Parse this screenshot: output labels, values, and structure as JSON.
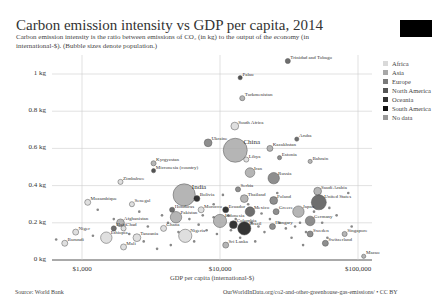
{
  "header": {
    "title": "Carbon emission intensity vs GDP per capita, 2014",
    "subtitle": "Carbon emission intensity is the ratio between emissions of CO₂ (in kg) to the output of the economy (in international-$). (Bubble sizes denote population.)"
  },
  "footer": {
    "source": "Source: World Bank",
    "url": "OurWorldInData.org/co2-and-other-greenhouse-gas-emissions/ • CC BY"
  },
  "legend": [
    {
      "label": "Africa",
      "color": "#d9d9d9"
    },
    {
      "label": "Asia",
      "color": "#a8a8a8"
    },
    {
      "label": "Europe",
      "color": "#7a7a7a"
    },
    {
      "label": "North America",
      "color": "#555555"
    },
    {
      "label": "Oceania",
      "color": "#333333"
    },
    {
      "label": "South America",
      "color": "#111111"
    },
    {
      "label": "No data",
      "color": "#999999"
    }
  ],
  "chart_data": {
    "type": "scatter",
    "title": "Carbon emission intensity vs GDP per capita, 2014",
    "subtitle": "Carbon emission intensity is the ratio between emissions of CO₂ (in kg) to the output of the economy (in international-$). (Bubble sizes denote population.)",
    "xlabel": "GDP per capita (international-$)",
    "ylabel": "",
    "xscale": "log",
    "xlim": [
      400,
      130000
    ],
    "ylim": [
      0,
      1.1
    ],
    "x_ticks": [
      "$1,000",
      "$10,000",
      "$100,000"
    ],
    "y_ticks": [
      "0 kg",
      "0.2 kg",
      "0.4 kg",
      "0.6 kg",
      "0.8 kg",
      "1 kg"
    ],
    "grid": true,
    "legend_position": "right",
    "points": [
      {
        "label": "Trinidad and Tobago",
        "x": 31000,
        "y": 1.07,
        "region": "North America",
        "size": 1.5
      },
      {
        "label": "Palau",
        "x": 14000,
        "y": 0.98,
        "region": "Oceania",
        "size": 1
      },
      {
        "label": "Turkmenistan",
        "x": 14500,
        "y": 0.87,
        "region": "Asia",
        "size": 1.5
      },
      {
        "label": "South Africa",
        "x": 12800,
        "y": 0.72,
        "region": "Africa",
        "size": 3
      },
      {
        "label": "Aruba",
        "x": 36000,
        "y": 0.65,
        "region": "North America",
        "size": 1
      },
      {
        "label": "Ukraine",
        "x": 8200,
        "y": 0.63,
        "region": "Europe",
        "size": 3
      },
      {
        "label": "China",
        "x": 12900,
        "y": 0.59,
        "region": "Asia",
        "size": 12
      },
      {
        "label": "Kazakhstan",
        "x": 23000,
        "y": 0.6,
        "region": "Asia",
        "size": 2
      },
      {
        "label": "Libya",
        "x": 15500,
        "y": 0.54,
        "region": "Africa",
        "size": 1.5
      },
      {
        "label": "Estonia",
        "x": 27000,
        "y": 0.55,
        "region": "Europe",
        "size": 1
      },
      {
        "label": "Bahrain",
        "x": 45000,
        "y": 0.53,
        "region": "Asia",
        "size": 1
      },
      {
        "label": "Kyrgyzstan",
        "x": 3300,
        "y": 0.52,
        "region": "Asia",
        "size": 1.5
      },
      {
        "label": "Micronesia (country)",
        "x": 3300,
        "y": 0.48,
        "region": "Oceania",
        "size": 1
      },
      {
        "label": "Iran",
        "x": 16500,
        "y": 0.47,
        "region": "Asia",
        "size": 4
      },
      {
        "label": "Russia",
        "x": 24500,
        "y": 0.44,
        "region": "Europe",
        "size": 5
      },
      {
        "label": "Zimbabwe",
        "x": 1900,
        "y": 0.42,
        "region": "Africa",
        "size": 1.5
      },
      {
        "label": "Serbia",
        "x": 13500,
        "y": 0.38,
        "region": "Europe",
        "size": 1.5
      },
      {
        "label": "Saudi Arabia",
        "x": 51000,
        "y": 0.37,
        "region": "Asia",
        "size": 3
      },
      {
        "label": "India",
        "x": 5500,
        "y": 0.35,
        "region": "Asia",
        "size": 11
      },
      {
        "label": "Bolivia",
        "x": 6800,
        "y": 0.33,
        "region": "South America",
        "size": 2
      },
      {
        "label": "United States",
        "x": 52000,
        "y": 0.31,
        "region": "North America",
        "size": 7
      },
      {
        "label": "Thailand",
        "x": 15000,
        "y": 0.33,
        "region": "Asia",
        "size": 3
      },
      {
        "label": "Poland",
        "x": 24500,
        "y": 0.32,
        "region": "Europe",
        "size": 3
      },
      {
        "label": "Mozambique",
        "x": 1100,
        "y": 0.31,
        "region": "Africa",
        "size": 2
      },
      {
        "label": "Senegal",
        "x": 2300,
        "y": 0.3,
        "region": "Africa",
        "size": 1.5
      },
      {
        "label": "Honduras",
        "x": 4500,
        "y": 0.27,
        "region": "North America",
        "size": 1.5
      },
      {
        "label": "Morocco",
        "x": 7300,
        "y": 0.27,
        "region": "Africa",
        "size": 2
      },
      {
        "label": "Ecuador",
        "x": 11000,
        "y": 0.27,
        "region": "South America",
        "size": 2
      },
      {
        "label": "Mexico",
        "x": 16500,
        "y": 0.26,
        "region": "North America",
        "size": 4
      },
      {
        "label": "Greece",
        "x": 25500,
        "y": 0.26,
        "region": "Europe",
        "size": 2
      },
      {
        "label": "Japan",
        "x": 37000,
        "y": 0.26,
        "region": "Asia",
        "size": 5
      },
      {
        "label": "Pakistan",
        "x": 4800,
        "y": 0.23,
        "region": "Asia",
        "size": 5
      },
      {
        "label": "Indonesia",
        "x": 10000,
        "y": 0.21,
        "region": "Asia",
        "size": 6
      },
      {
        "label": "Germany",
        "x": 45000,
        "y": 0.21,
        "region": "Europe",
        "size": 4
      },
      {
        "label": "Afghanistan",
        "x": 1900,
        "y": 0.2,
        "region": "Asia",
        "size": 3
      },
      {
        "label": "Colombia",
        "x": 12500,
        "y": 0.19,
        "region": "South America",
        "size": 3
      },
      {
        "label": "Hungary",
        "x": 24000,
        "y": 0.18,
        "region": "Europe",
        "size": 2
      },
      {
        "label": "Brazil",
        "x": 15000,
        "y": 0.17,
        "region": "South America",
        "size": 6
      },
      {
        "label": "Haiti",
        "x": 1700,
        "y": 0.17,
        "region": "North America",
        "size": 1.5
      },
      {
        "label": "Chad",
        "x": 2000,
        "y": 0.17,
        "region": "Africa",
        "size": 1.5
      },
      {
        "label": "Ghana",
        "x": 3900,
        "y": 0.17,
        "region": "Africa",
        "size": 2
      },
      {
        "label": "Sweden",
        "x": 45000,
        "y": 0.14,
        "region": "Europe",
        "size": 2
      },
      {
        "label": "Singapore",
        "x": 80000,
        "y": 0.14,
        "region": "Asia",
        "size": 1.5
      },
      {
        "label": "Niger",
        "x": 900,
        "y": 0.15,
        "region": "Africa",
        "size": 2
      },
      {
        "label": "Ethiopia",
        "x": 1500,
        "y": 0.12,
        "region": "Africa",
        "size": 5
      },
      {
        "label": "Tanzania",
        "x": 2500,
        "y": 0.12,
        "region": "Africa",
        "size": 3
      },
      {
        "label": "Nigeria",
        "x": 5600,
        "y": 0.13,
        "region": "Africa",
        "size": 6
      },
      {
        "label": "Switzerland",
        "x": 58000,
        "y": 0.09,
        "region": "Europe",
        "size": 2
      },
      {
        "label": "Burundi",
        "x": 750,
        "y": 0.09,
        "region": "Africa",
        "size": 2
      },
      {
        "label": "Mali",
        "x": 2000,
        "y": 0.07,
        "region": "Africa",
        "size": 2
      },
      {
        "label": "Sri Lanka",
        "x": 11000,
        "y": 0.08,
        "region": "Asia",
        "size": 2
      },
      {
        "label": "Macao",
        "x": 110000,
        "y": 0.02,
        "region": "Asia",
        "size": 1
      }
    ]
  }
}
